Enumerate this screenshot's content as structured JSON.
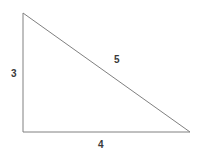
{
  "figure": {
    "type": "right-triangle",
    "background_color": "#ffffff",
    "stroke_color": "#808080",
    "stroke_width": 1,
    "label_color": "#3a3a3a",
    "vertices": {
      "apex": {
        "x": 23,
        "y": 13
      },
      "right_angle": {
        "x": 23,
        "y": 132
      },
      "bottom_right": {
        "x": 190,
        "y": 132
      }
    },
    "labels": {
      "vertical_leg": "3",
      "hypotenuse": "5",
      "horizontal_leg": "4"
    }
  },
  "chart_data": {
    "type": "diagram",
    "title": "",
    "shape": "right triangle",
    "sides": [
      {
        "name": "vertical leg",
        "label": "3",
        "value": 3,
        "from": "apex",
        "to": "right_angle"
      },
      {
        "name": "horizontal leg",
        "label": "4",
        "value": 4,
        "from": "right_angle",
        "to": "bottom_right"
      },
      {
        "name": "hypotenuse",
        "label": "5",
        "value": 5,
        "from": "apex",
        "to": "bottom_right"
      }
    ],
    "annotations": [
      "3",
      "5",
      "4"
    ]
  }
}
